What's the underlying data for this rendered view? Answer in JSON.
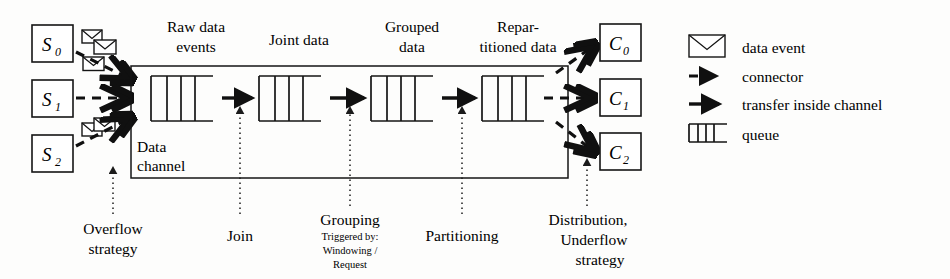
{
  "figure": {
    "background": "#fdfdfc",
    "ink": "#141414"
  },
  "sources": [
    {
      "id": "s0",
      "label": "S",
      "sub": "0",
      "envelopes": 2
    },
    {
      "id": "s1",
      "label": "S",
      "sub": "1",
      "envelopes": 1
    },
    {
      "id": "s2",
      "label": "S",
      "sub": "2",
      "envelopes": 2
    }
  ],
  "consumers": [
    {
      "id": "c0",
      "label": "C",
      "sub": "0"
    },
    {
      "id": "c1",
      "label": "C",
      "sub": "1"
    },
    {
      "id": "c2",
      "label": "C",
      "sub": "2"
    }
  ],
  "channel": {
    "name_line1": "Data",
    "name_line2": "channel"
  },
  "stage_headers": [
    {
      "id": "raw",
      "line1": "Raw data",
      "line2": "events"
    },
    {
      "id": "joint",
      "line1": "Joint data",
      "line2": ""
    },
    {
      "id": "grouped",
      "line1": "Grouped",
      "line2": "data"
    },
    {
      "id": "repartitioned",
      "line1": "Repar-",
      "line2": "titioned data"
    }
  ],
  "bottom_annotations": [
    {
      "id": "overflow",
      "line1": "Overflow",
      "line2": "strategy",
      "line3": "",
      "small": []
    },
    {
      "id": "join",
      "line1": "Join",
      "line2": "",
      "line3": "",
      "small": []
    },
    {
      "id": "grouping",
      "line1": "Grouping",
      "line2": "",
      "line3": "",
      "small": [
        "Triggered by:",
        "Windowing /",
        "Request"
      ]
    },
    {
      "id": "partitioning",
      "line1": "Partitioning",
      "line2": "",
      "line3": "",
      "small": []
    },
    {
      "id": "distribution",
      "line1": "Distribution,",
      "line2": "Underflow",
      "line3": "strategy",
      "small": []
    }
  ],
  "legend": [
    {
      "id": "data-event",
      "icon": "envelope-icon",
      "label": "data event"
    },
    {
      "id": "connector",
      "icon": "dashed-arrow-icon",
      "label": "connector"
    },
    {
      "id": "transfer",
      "icon": "solid-arrow-icon",
      "label": "transfer inside channel"
    },
    {
      "id": "queue",
      "icon": "queue-icon",
      "label": "queue"
    }
  ]
}
